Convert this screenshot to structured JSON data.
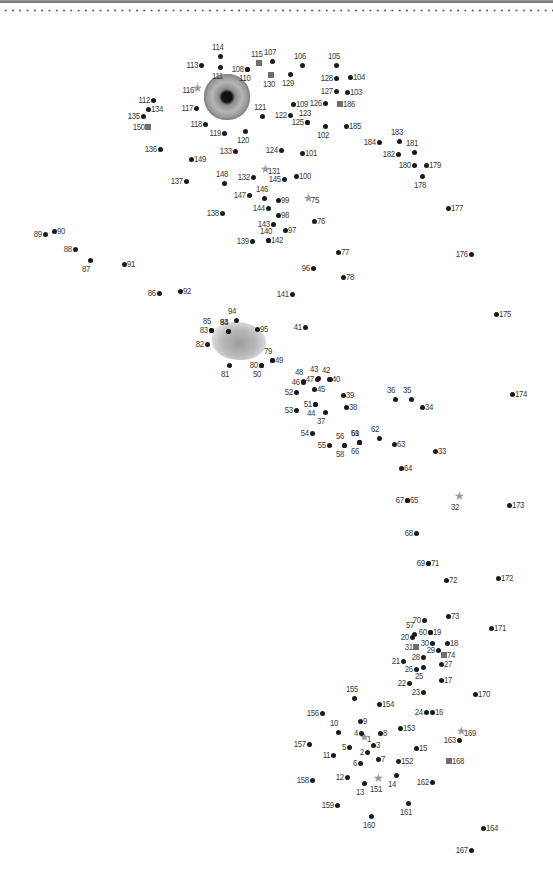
{
  "page": {
    "colors": {
      "dot": "#1a1a1a",
      "square": "#6e6e6e",
      "star": "#9a9a9a",
      "label": "#3a3a3a"
    }
  },
  "images": [
    {
      "name": "eye-image",
      "x": 204,
      "y": 74
    },
    {
      "name": "fluffy-image",
      "x": 212,
      "y": 322
    }
  ],
  "dots": [
    {
      "n": "1",
      "x": 364,
      "y": 739,
      "m": "star",
      "p": "r"
    },
    {
      "n": "2",
      "x": 367,
      "y": 752,
      "m": "dot",
      "p": "l"
    },
    {
      "n": "3",
      "x": 373,
      "y": 745,
      "m": "dot",
      "p": "r"
    },
    {
      "n": "4",
      "x": 361,
      "y": 733,
      "m": "dot",
      "p": "l"
    },
    {
      "n": "5",
      "x": 349,
      "y": 747,
      "m": "dot",
      "p": "l"
    },
    {
      "n": "6",
      "x": 360,
      "y": 763,
      "m": "dot",
      "p": "l"
    },
    {
      "n": "7",
      "x": 378,
      "y": 759,
      "m": "dot",
      "p": "r"
    },
    {
      "n": "8",
      "x": 380,
      "y": 733,
      "m": "dot",
      "p": "r"
    },
    {
      "n": "9",
      "x": 360,
      "y": 721,
      "m": "dot",
      "p": "r"
    },
    {
      "n": "10",
      "x": 338,
      "y": 732,
      "m": "dot",
      "p": "t"
    },
    {
      "n": "11",
      "x": 333,
      "y": 755,
      "m": "dot",
      "p": "l"
    },
    {
      "n": "12",
      "x": 347,
      "y": 777,
      "m": "dot",
      "p": "l"
    },
    {
      "n": "13",
      "x": 364,
      "y": 783,
      "m": "dot",
      "p": "b"
    },
    {
      "n": "14",
      "x": 396,
      "y": 775,
      "m": "dot",
      "p": "b"
    },
    {
      "n": "15",
      "x": 416,
      "y": 748,
      "m": "dot",
      "p": "r"
    },
    {
      "n": "16",
      "x": 432,
      "y": 712,
      "m": "dot",
      "p": "r"
    },
    {
      "n": "17",
      "x": 441,
      "y": 680,
      "m": "dot",
      "p": "r"
    },
    {
      "n": "18",
      "x": 447,
      "y": 643,
      "m": "dot",
      "p": "r"
    },
    {
      "n": "19",
      "x": 430,
      "y": 632,
      "m": "dot",
      "p": "r"
    },
    {
      "n": "20",
      "x": 412,
      "y": 637,
      "m": "dot",
      "p": "l"
    },
    {
      "n": "21",
      "x": 403,
      "y": 661,
      "m": "dot",
      "p": "l"
    },
    {
      "n": "22",
      "x": 409,
      "y": 683,
      "m": "dot",
      "p": "l"
    },
    {
      "n": "23",
      "x": 423,
      "y": 692,
      "m": "dot",
      "p": "l"
    },
    {
      "n": "24",
      "x": 426,
      "y": 712,
      "m": "dot",
      "p": "l"
    },
    {
      "n": "25",
      "x": 423,
      "y": 667,
      "m": "dot",
      "p": "b"
    },
    {
      "n": "26",
      "x": 416,
      "y": 669,
      "m": "dot",
      "p": "l"
    },
    {
      "n": "27",
      "x": 441,
      "y": 664,
      "m": "dot",
      "p": "r"
    },
    {
      "n": "28",
      "x": 423,
      "y": 657,
      "m": "dot",
      "p": "l"
    },
    {
      "n": "29",
      "x": 438,
      "y": 650,
      "m": "dot",
      "p": "l"
    },
    {
      "n": "30",
      "x": 432,
      "y": 643,
      "m": "dot",
      "p": "l"
    },
    {
      "n": "31",
      "x": 416,
      "y": 647,
      "m": "square",
      "p": "l"
    },
    {
      "n": "32",
      "x": 459,
      "y": 498,
      "m": "star",
      "p": "b"
    },
    {
      "n": "33",
      "x": 435,
      "y": 451,
      "m": "dot",
      "p": "r"
    },
    {
      "n": "34",
      "x": 422,
      "y": 407,
      "m": "dot",
      "p": "r"
    },
    {
      "n": "35",
      "x": 411,
      "y": 399,
      "m": "dot",
      "p": "t"
    },
    {
      "n": "36",
      "x": 395,
      "y": 399,
      "m": "dot",
      "p": "t"
    },
    {
      "n": "37",
      "x": 325,
      "y": 412,
      "m": "dot",
      "p": "b"
    },
    {
      "n": "38",
      "x": 346,
      "y": 407,
      "m": "dot",
      "p": "r"
    },
    {
      "n": "39",
      "x": 343,
      "y": 395,
      "m": "dot",
      "p": "r"
    },
    {
      "n": "40",
      "x": 329,
      "y": 379,
      "m": "dot",
      "p": "r"
    },
    {
      "n": "41",
      "x": 305,
      "y": 327,
      "m": "dot",
      "p": "l"
    },
    {
      "n": "42",
      "x": 330,
      "y": 379,
      "m": "dot",
      "p": "t"
    },
    {
      "n": "43",
      "x": 318,
      "y": 378,
      "m": "dot",
      "p": "t"
    },
    {
      "n": "44",
      "x": 315,
      "y": 404,
      "m": "dot",
      "p": "b"
    },
    {
      "n": "45",
      "x": 314,
      "y": 389,
      "m": "dot",
      "p": "r"
    },
    {
      "n": "46",
      "x": 303,
      "y": 382,
      "m": "dot",
      "p": "l"
    },
    {
      "n": "47",
      "x": 317,
      "y": 379,
      "m": "dot",
      "p": "l"
    },
    {
      "n": "48",
      "x": 303,
      "y": 381,
      "m": "dot",
      "p": "t"
    },
    {
      "n": "49",
      "x": 272,
      "y": 360,
      "m": "dot",
      "p": "r"
    },
    {
      "n": "50",
      "x": 261,
      "y": 365,
      "m": "dot",
      "p": "b"
    },
    {
      "n": "51",
      "x": 315,
      "y": 404,
      "m": "dot",
      "p": "l"
    },
    {
      "n": "52",
      "x": 296,
      "y": 392,
      "m": "dot",
      "p": "l"
    },
    {
      "n": "53",
      "x": 296,
      "y": 410,
      "m": "dot",
      "p": "l"
    },
    {
      "n": "54",
      "x": 312,
      "y": 433,
      "m": "dot",
      "p": "l"
    },
    {
      "n": "55",
      "x": 329,
      "y": 445,
      "m": "dot",
      "p": "l"
    },
    {
      "n": "56",
      "x": 344,
      "y": 445,
      "m": "dot",
      "p": "t"
    },
    {
      "n": "57",
      "x": 414,
      "y": 634,
      "m": "dot",
      "p": "t"
    },
    {
      "n": "58",
      "x": 344,
      "y": 445,
      "m": "dot",
      "p": "b"
    },
    {
      "n": "59",
      "x": 359,
      "y": 442,
      "m": "dot",
      "p": "t"
    },
    {
      "n": "60",
      "x": 430,
      "y": 632,
      "m": "dot",
      "p": "l"
    },
    {
      "n": "61",
      "x": 359,
      "y": 442,
      "m": "dot",
      "p": "t"
    },
    {
      "n": "62",
      "x": 379,
      "y": 438,
      "m": "dot",
      "p": "t"
    },
    {
      "n": "63",
      "x": 394,
      "y": 444,
      "m": "dot",
      "p": "r"
    },
    {
      "n": "64",
      "x": 401,
      "y": 468,
      "m": "dot",
      "p": "r"
    },
    {
      "n": "65",
      "x": 407,
      "y": 500,
      "m": "dot",
      "p": "r"
    },
    {
      "n": "66",
      "x": 359,
      "y": 442,
      "m": "dot",
      "p": "b"
    },
    {
      "n": "67",
      "x": 407,
      "y": 500,
      "m": "dot",
      "p": "l"
    },
    {
      "n": "68",
      "x": 416,
      "y": 533,
      "m": "dot",
      "p": "l"
    },
    {
      "n": "69",
      "x": 428,
      "y": 563,
      "m": "dot",
      "p": "l"
    },
    {
      "n": "70",
      "x": 424,
      "y": 620,
      "m": "dot",
      "p": "l"
    },
    {
      "n": "71",
      "x": 428,
      "y": 563,
      "m": "dot",
      "p": "r"
    },
    {
      "n": "72",
      "x": 446,
      "y": 580,
      "m": "dot",
      "p": "r"
    },
    {
      "n": "73",
      "x": 448,
      "y": 616,
      "m": "dot",
      "p": "r"
    },
    {
      "n": "74",
      "x": 444,
      "y": 655,
      "m": "square",
      "p": "r"
    },
    {
      "n": "75",
      "x": 308,
      "y": 200,
      "m": "star",
      "p": "r"
    },
    {
      "n": "76",
      "x": 314,
      "y": 221,
      "m": "dot",
      "p": "r"
    },
    {
      "n": "77",
      "x": 338,
      "y": 252,
      "m": "dot",
      "p": "r"
    },
    {
      "n": "78",
      "x": 343,
      "y": 277,
      "m": "dot",
      "p": "r"
    },
    {
      "n": "79",
      "x": 272,
      "y": 360,
      "m": "dot",
      "p": "t"
    },
    {
      "n": "80",
      "x": 261,
      "y": 365,
      "m": "dot",
      "p": "l"
    },
    {
      "n": "81",
      "x": 229,
      "y": 365,
      "m": "dot",
      "p": "b"
    },
    {
      "n": "82",
      "x": 207,
      "y": 344,
      "m": "dot",
      "p": "l"
    },
    {
      "n": "83",
      "x": 211,
      "y": 330,
      "m": "dot",
      "p": "l"
    },
    {
      "n": "84",
      "x": 228,
      "y": 331,
      "m": "dot",
      "p": "t"
    },
    {
      "n": "85",
      "x": 211,
      "y": 330,
      "m": "dot",
      "p": "t"
    },
    {
      "n": "86",
      "x": 159,
      "y": 293,
      "m": "dot",
      "p": "l"
    },
    {
      "n": "87",
      "x": 90,
      "y": 260,
      "m": "dot",
      "p": "b"
    },
    {
      "n": "88",
      "x": 75,
      "y": 249,
      "m": "dot",
      "p": "l"
    },
    {
      "n": "89",
      "x": 45,
      "y": 234,
      "m": "dot",
      "p": "l"
    },
    {
      "n": "90",
      "x": 54,
      "y": 231,
      "m": "dot",
      "p": "r"
    },
    {
      "n": "91",
      "x": 124,
      "y": 264,
      "m": "dot",
      "p": "r"
    },
    {
      "n": "92",
      "x": 180,
      "y": 291,
      "m": "dot",
      "p": "r"
    },
    {
      "n": "93",
      "x": 228,
      "y": 331,
      "m": "dot",
      "p": "t"
    },
    {
      "n": "94",
      "x": 236,
      "y": 320,
      "m": "dot",
      "p": "t"
    },
    {
      "n": "95",
      "x": 257,
      "y": 329,
      "m": "dot",
      "p": "r"
    },
    {
      "n": "96",
      "x": 313,
      "y": 268,
      "m": "dot",
      "p": "l"
    },
    {
      "n": "97",
      "x": 285,
      "y": 230,
      "m": "dot",
      "p": "r"
    },
    {
      "n": "98",
      "x": 278,
      "y": 215,
      "m": "dot",
      "p": "r"
    },
    {
      "n": "99",
      "x": 278,
      "y": 200,
      "m": "dot",
      "p": "r"
    },
    {
      "n": "100",
      "x": 296,
      "y": 176,
      "m": "dot",
      "p": "r"
    },
    {
      "n": "101",
      "x": 302,
      "y": 153,
      "m": "dot",
      "p": "r"
    },
    {
      "n": "102",
      "x": 325,
      "y": 126,
      "m": "dot",
      "p": "b"
    },
    {
      "n": "103",
      "x": 347,
      "y": 92,
      "m": "dot",
      "p": "r"
    },
    {
      "n": "104",
      "x": 350,
      "y": 77,
      "m": "dot",
      "p": "r"
    },
    {
      "n": "105",
      "x": 336,
      "y": 65,
      "m": "dot",
      "p": "t"
    },
    {
      "n": "106",
      "x": 302,
      "y": 65,
      "m": "dot",
      "p": "t"
    },
    {
      "n": "107",
      "x": 272,
      "y": 61,
      "m": "dot",
      "p": "t"
    },
    {
      "n": "108",
      "x": 247,
      "y": 69,
      "m": "dot",
      "p": "l"
    },
    {
      "n": "109",
      "x": 293,
      "y": 104,
      "m": "dot",
      "p": "r"
    },
    {
      "n": "110",
      "x": 247,
      "y": 69,
      "m": "dot",
      "p": "b"
    },
    {
      "n": "111",
      "x": 220,
      "y": 67,
      "m": "dot",
      "p": "b"
    },
    {
      "n": "112",
      "x": 153,
      "y": 100,
      "m": "dot",
      "p": "l"
    },
    {
      "n": "113",
      "x": 201,
      "y": 65,
      "m": "dot",
      "p": "l"
    },
    {
      "n": "114",
      "x": 220,
      "y": 56,
      "m": "dot",
      "p": "t"
    },
    {
      "n": "115",
      "x": 259,
      "y": 63,
      "m": "square",
      "p": "t"
    },
    {
      "n": "116",
      "x": 197,
      "y": 90,
      "m": "star",
      "p": "l"
    },
    {
      "n": "117",
      "x": 196,
      "y": 108,
      "m": "dot",
      "p": "l"
    },
    {
      "n": "118",
      "x": 205,
      "y": 124,
      "m": "dot",
      "p": "l"
    },
    {
      "n": "119",
      "x": 224,
      "y": 133,
      "m": "dot",
      "p": "l"
    },
    {
      "n": "120",
      "x": 245,
      "y": 131,
      "m": "dot",
      "p": "b"
    },
    {
      "n": "121",
      "x": 262,
      "y": 116,
      "m": "dot",
      "p": "t"
    },
    {
      "n": "122",
      "x": 290,
      "y": 115,
      "m": "dot",
      "p": "l"
    },
    {
      "n": "123",
      "x": 307,
      "y": 122,
      "m": "dot",
      "p": "t"
    },
    {
      "n": "124",
      "x": 281,
      "y": 150,
      "m": "dot",
      "p": "l"
    },
    {
      "n": "125",
      "x": 307,
      "y": 122,
      "m": "dot",
      "p": "l"
    },
    {
      "n": "126",
      "x": 325,
      "y": 103,
      "m": "dot",
      "p": "l"
    },
    {
      "n": "127",
      "x": 336,
      "y": 91,
      "m": "dot",
      "p": "l"
    },
    {
      "n": "128",
      "x": 336,
      "y": 78,
      "m": "dot",
      "p": "l"
    },
    {
      "n": "129",
      "x": 290,
      "y": 74,
      "m": "dot",
      "p": "b"
    },
    {
      "n": "130",
      "x": 271,
      "y": 75,
      "m": "square",
      "p": "b"
    },
    {
      "n": "131",
      "x": 265,
      "y": 171,
      "m": "star",
      "p": "r"
    },
    {
      "n": "132",
      "x": 253,
      "y": 177,
      "m": "dot",
      "p": "l"
    },
    {
      "n": "133",
      "x": 235,
      "y": 151,
      "m": "dot",
      "p": "l"
    },
    {
      "n": "134",
      "x": 148,
      "y": 109,
      "m": "dot",
      "p": "r"
    },
    {
      "n": "135",
      "x": 143,
      "y": 116,
      "m": "dot",
      "p": "l"
    },
    {
      "n": "136",
      "x": 160,
      "y": 149,
      "m": "dot",
      "p": "l"
    },
    {
      "n": "137",
      "x": 186,
      "y": 181,
      "m": "dot",
      "p": "l"
    },
    {
      "n": "138",
      "x": 222,
      "y": 213,
      "m": "dot",
      "p": "l"
    },
    {
      "n": "139",
      "x": 252,
      "y": 241,
      "m": "dot",
      "p": "l"
    },
    {
      "n": "140",
      "x": 268,
      "y": 240,
      "m": "dot",
      "p": "t"
    },
    {
      "n": "141",
      "x": 292,
      "y": 294,
      "m": "dot",
      "p": "l"
    },
    {
      "n": "142",
      "x": 268,
      "y": 240,
      "m": "dot",
      "p": "r"
    },
    {
      "n": "143",
      "x": 273,
      "y": 224,
      "m": "dot",
      "p": "l"
    },
    {
      "n": "144",
      "x": 268,
      "y": 208,
      "m": "dot",
      "p": "l"
    },
    {
      "n": "145",
      "x": 284,
      "y": 179,
      "m": "dot",
      "p": "l"
    },
    {
      "n": "146",
      "x": 264,
      "y": 198,
      "m": "dot",
      "p": "t"
    },
    {
      "n": "147",
      "x": 249,
      "y": 195,
      "m": "dot",
      "p": "l"
    },
    {
      "n": "148",
      "x": 224,
      "y": 183,
      "m": "dot",
      "p": "t"
    },
    {
      "n": "149",
      "x": 191,
      "y": 159,
      "m": "dot",
      "p": "r"
    },
    {
      "n": "150",
      "x": 148,
      "y": 127,
      "m": "square",
      "p": "l"
    },
    {
      "n": "151",
      "x": 378,
      "y": 780,
      "m": "star",
      "p": "b"
    },
    {
      "n": "152",
      "x": 398,
      "y": 761,
      "m": "dot",
      "p": "r"
    },
    {
      "n": "153",
      "x": 400,
      "y": 728,
      "m": "dot",
      "p": "r"
    },
    {
      "n": "154",
      "x": 379,
      "y": 704,
      "m": "dot",
      "p": "r"
    },
    {
      "n": "155",
      "x": 354,
      "y": 698,
      "m": "dot",
      "p": "t"
    },
    {
      "n": "156",
      "x": 322,
      "y": 713,
      "m": "dot",
      "p": "l"
    },
    {
      "n": "157",
      "x": 309,
      "y": 744,
      "m": "dot",
      "p": "l"
    },
    {
      "n": "158",
      "x": 312,
      "y": 780,
      "m": "dot",
      "p": "l"
    },
    {
      "n": "159",
      "x": 337,
      "y": 805,
      "m": "dot",
      "p": "l"
    },
    {
      "n": "160",
      "x": 371,
      "y": 816,
      "m": "dot",
      "p": "b"
    },
    {
      "n": "161",
      "x": 408,
      "y": 803,
      "m": "dot",
      "p": "b"
    },
    {
      "n": "162",
      "x": 432,
      "y": 782,
      "m": "dot",
      "p": "l"
    },
    {
      "n": "163",
      "x": 459,
      "y": 740,
      "m": "dot",
      "p": "l"
    },
    {
      "n": "164",
      "x": 483,
      "y": 828,
      "m": "dot",
      "p": "r"
    },
    {
      "n": "167",
      "x": 471,
      "y": 850,
      "m": "dot",
      "p": "l"
    },
    {
      "n": "168",
      "x": 449,
      "y": 761,
      "m": "square",
      "p": "r"
    },
    {
      "n": "169",
      "x": 461,
      "y": 733,
      "m": "star",
      "p": "r"
    },
    {
      "n": "170",
      "x": 475,
      "y": 694,
      "m": "dot",
      "p": "r"
    },
    {
      "n": "171",
      "x": 491,
      "y": 628,
      "m": "dot",
      "p": "r"
    },
    {
      "n": "172",
      "x": 498,
      "y": 578,
      "m": "dot",
      "p": "r"
    },
    {
      "n": "173",
      "x": 509,
      "y": 505,
      "m": "dot",
      "p": "r"
    },
    {
      "n": "174",
      "x": 512,
      "y": 394,
      "m": "dot",
      "p": "r"
    },
    {
      "n": "175",
      "x": 496,
      "y": 314,
      "m": "dot",
      "p": "r"
    },
    {
      "n": "176",
      "x": 471,
      "y": 254,
      "m": "dot",
      "p": "l"
    },
    {
      "n": "177",
      "x": 448,
      "y": 208,
      "m": "dot",
      "p": "r"
    },
    {
      "n": "178",
      "x": 422,
      "y": 176,
      "m": "dot",
      "p": "b"
    },
    {
      "n": "179",
      "x": 426,
      "y": 165,
      "m": "dot",
      "p": "r"
    },
    {
      "n": "180",
      "x": 414,
      "y": 165,
      "m": "dot",
      "p": "l"
    },
    {
      "n": "181",
      "x": 414,
      "y": 152,
      "m": "dot",
      "p": "t"
    },
    {
      "n": "182",
      "x": 398,
      "y": 154,
      "m": "dot",
      "p": "l"
    },
    {
      "n": "183",
      "x": 399,
      "y": 141,
      "m": "dot",
      "p": "t"
    },
    {
      "n": "184",
      "x": 379,
      "y": 142,
      "m": "dot",
      "p": "l"
    },
    {
      "n": "185",
      "x": 346,
      "y": 126,
      "m": "dot",
      "p": "r"
    },
    {
      "n": "186",
      "x": 340,
      "y": 104,
      "m": "square",
      "p": "r"
    }
  ]
}
